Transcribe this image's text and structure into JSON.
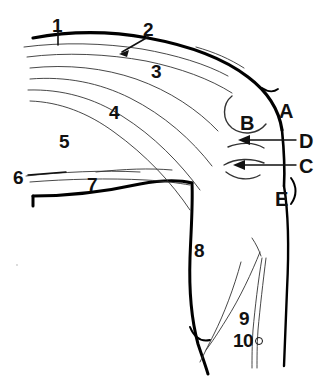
{
  "figure": {
    "kind": "anatomical-line-drawing",
    "background_color": "#ffffff",
    "ink_color": "#111111",
    "thick_stroke_color": "#000000",
    "thin_stroke_color": "#333333",
    "number_labels": [
      {
        "id": "1",
        "text": "1",
        "x": 52,
        "y": 16,
        "leader": "tick"
      },
      {
        "id": "2",
        "text": "2",
        "x": 143,
        "y": 20,
        "leader": "arrow"
      },
      {
        "id": "3",
        "text": "3",
        "x": 151,
        "y": 62,
        "leader": "none"
      },
      {
        "id": "4",
        "text": "4",
        "x": 109,
        "y": 103,
        "leader": "none"
      },
      {
        "id": "5",
        "text": "5",
        "x": 59,
        "y": 132,
        "leader": "none"
      },
      {
        "id": "6",
        "text": "6",
        "x": 13,
        "y": 168,
        "leader": "line"
      },
      {
        "id": "7",
        "text": "7",
        "x": 87,
        "y": 175,
        "leader": "none"
      },
      {
        "id": "8",
        "text": "8",
        "x": 194,
        "y": 241,
        "leader": "none"
      },
      {
        "id": "9",
        "text": "9",
        "x": 239,
        "y": 309,
        "leader": "none"
      },
      {
        "id": "10",
        "text": "10",
        "x": 233,
        "y": 331,
        "leader": "none",
        "marker": "small-circle"
      }
    ],
    "letter_labels": [
      {
        "id": "A",
        "text": "A",
        "x": 279,
        "y": 101,
        "leader": "none"
      },
      {
        "id": "B",
        "text": "B",
        "x": 240,
        "y": 113,
        "leader": "none"
      },
      {
        "id": "C",
        "text": "C",
        "x": 299,
        "y": 156,
        "leader": "arrow-left"
      },
      {
        "id": "D",
        "text": "D",
        "x": 299,
        "y": 131,
        "leader": "arrow-left"
      },
      {
        "id": "E",
        "text": "E",
        "x": 275,
        "y": 189,
        "leader": "none"
      }
    ]
  }
}
